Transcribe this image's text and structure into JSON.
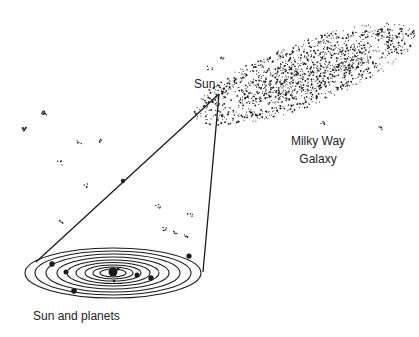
{
  "labels": {
    "sun": "Sun",
    "galaxy_line1": "Milky Way",
    "galaxy_line2": "Galaxy",
    "solar_system": "Sun and planets"
  },
  "colors": {
    "ink": "#1a1a1a",
    "background": "#ffffff"
  }
}
